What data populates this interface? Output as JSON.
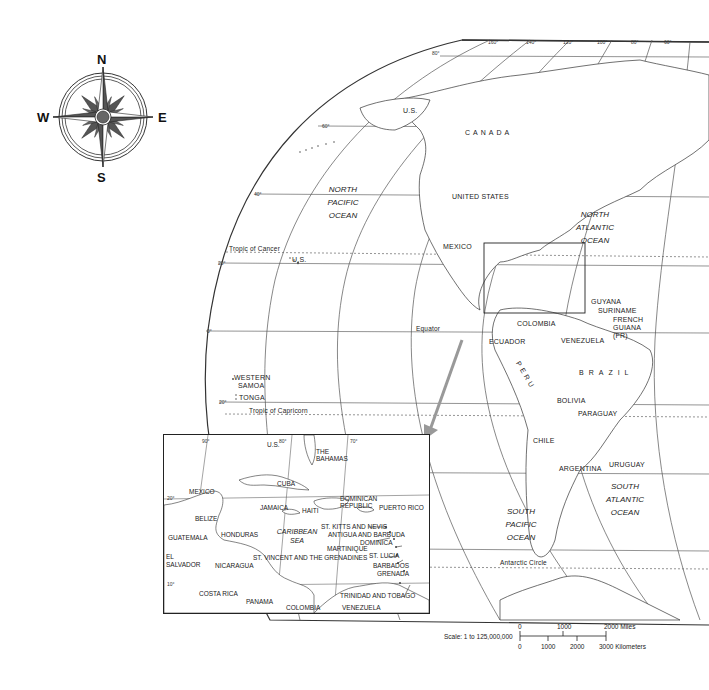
{
  "compass": {
    "north": "N",
    "south": "S",
    "east": "E",
    "west": "W",
    "icon": "compass-rose-icon"
  },
  "graticule": {
    "longitudes_top": [
      "80°",
      "160°",
      "140°",
      "120°",
      "100°",
      "80°",
      "60°"
    ],
    "latitudes": [
      "60°",
      "40°",
      "20°",
      "0°",
      "20°"
    ],
    "lines": {
      "tropic_cancer": "Tropic of Cancer",
      "equator": "Equator",
      "tropic_capricorn": "Tropic of Capricorn",
      "antarctic_circle": "Antarctic Circle"
    }
  },
  "oceans": {
    "north_pacific": [
      "NORTH",
      "PACIFIC",
      "OCEAN"
    ],
    "north_atlantic": [
      "NORTH",
      "ATLANTIC",
      "OCEAN"
    ],
    "south_pacific": [
      "SOUTH",
      "PACIFIC",
      "OCEAN"
    ],
    "south_atlantic": [
      "SOUTH",
      "ATLANTIC",
      "OCEAN"
    ]
  },
  "countries": {
    "us_alaska": "U.S.",
    "canada": "CANADA",
    "united_states": "UNITED STATES",
    "us_hawaii": "U.S.",
    "mexico": "MEXICO",
    "guyana": "GUYANA",
    "suriname": "SURINAME",
    "french_guiana": [
      "FRENCH",
      "GUIANA",
      "(FR)"
    ],
    "colombia": "COLOMBIA",
    "venezuela": "VENEZUELA",
    "ecuador": "ECUADOR",
    "peru": "PERU",
    "brazil": "BRAZIL",
    "bolivia": "BOLIVIA",
    "paraguay": "PARAGUAY",
    "chile": "CHILE",
    "argentina": "ARGENTINA",
    "uruguay": "URUGUAY",
    "western_samoa": [
      "WESTERN",
      "SAMOA"
    ],
    "tonga": "TONGA"
  },
  "inset": {
    "degrees": {
      "lon90": "90°",
      "lon80": "80°",
      "lon70": "70°",
      "lat20": "20°",
      "lat10": "10°"
    },
    "labels": {
      "us": "U.S.",
      "bahamas": [
        "THE",
        "BAHAMAS"
      ],
      "mexico": "MEXICO",
      "cuba": "CUBA",
      "dominican_republic": [
        "DOMINICAN",
        "REPUBLIC"
      ],
      "puerto_rico": "PUERTO RICO",
      "belize": "BELIZE",
      "jamaica": "JAMAICA",
      "haiti": "HAITI",
      "st_kitts": "ST. KITTS AND NEVIS",
      "antigua": "ANTIGUA AND BARBUDA",
      "dominica": "DOMINICA",
      "guatemala": "GUATEMALA",
      "honduras": "HONDURAS",
      "caribbean_sea": [
        "CARIBBEAN",
        "SEA"
      ],
      "martinique": "MARTINIQUE",
      "st_lucia": "ST. LUCIA",
      "el_salvador": [
        "EL",
        "SALVADOR"
      ],
      "nicaragua": "NICARAGUA",
      "st_vincent": "ST. VINCENT AND THE GRENADINES",
      "barbados": "BARBADOS",
      "grenada": "GRENADA",
      "costa_rica": "COSTA RICA",
      "panama": "PANAMA",
      "trinidad": "TRINIDAD AND TOBAGO",
      "colombia": "COLOMBIA",
      "venezuela": "VENEZUELA"
    }
  },
  "scale": {
    "label": "Scale:  1 to 125,000,000",
    "miles_ticks": [
      "0",
      "1000",
      "2000 Miles"
    ],
    "km_ticks": [
      "0",
      "1000",
      "2000",
      "3000 Kilometers"
    ]
  }
}
